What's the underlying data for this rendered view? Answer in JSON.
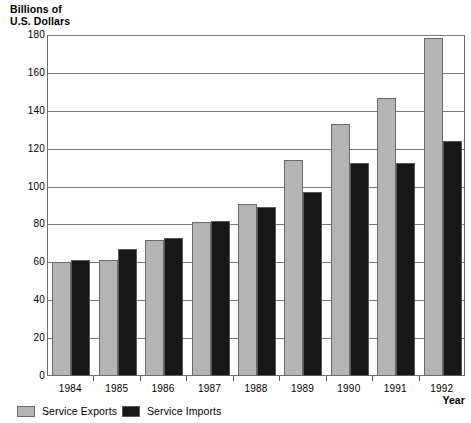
{
  "chart_data": {
    "type": "bar",
    "title": "",
    "ylabel": "Billions of\nU.S. Dollars",
    "xlabel": "Year",
    "categories": [
      "1984",
      "1985",
      "1986",
      "1987",
      "1988",
      "1989",
      "1990",
      "1991",
      "1992"
    ],
    "series": [
      {
        "name": "Service Exports",
        "color": "#b4b4b4",
        "values": [
          60,
          61.5,
          72,
          81.5,
          91,
          114,
          133,
          147,
          178.5
        ]
      },
      {
        "name": "Service Imports",
        "color": "#171717",
        "values": [
          61,
          67,
          73,
          82,
          89,
          97,
          112.5,
          112.5,
          124
        ]
      }
    ],
    "ylim": [
      0,
      180
    ],
    "ytick_labels": [
      "180",
      "160",
      "140",
      "120",
      "100",
      "80",
      "60",
      "40",
      "20",
      "0"
    ],
    "ytick_values": [
      180,
      160,
      140,
      120,
      100,
      80,
      60,
      40,
      20,
      0
    ],
    "grid": true,
    "legend_position": "bottom-left"
  }
}
